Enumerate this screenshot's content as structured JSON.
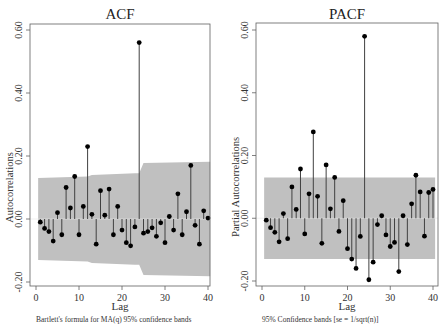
{
  "chart_data": [
    {
      "type": "stem",
      "title": "ACF",
      "xlabel": "Lag",
      "ylabel": "Autocorrelations",
      "note": "Bartlett's formula for MA(q) 95% confidence bands",
      "xlim": [
        0,
        40
      ],
      "ylim": [
        -0.2,
        0.6
      ],
      "xticks": [
        0,
        10,
        20,
        30,
        40
      ],
      "yticks": [
        "-0.20",
        "0.00",
        "0.20",
        "0.40",
        "0.60"
      ],
      "grid": false,
      "lags": [
        1,
        2,
        3,
        4,
        5,
        6,
        7,
        8,
        9,
        10,
        11,
        12,
        13,
        14,
        15,
        16,
        17,
        18,
        19,
        20,
        21,
        22,
        23,
        24,
        25,
        26,
        27,
        28,
        29,
        30,
        31,
        32,
        33,
        34,
        35,
        36,
        37,
        38,
        39,
        40
      ],
      "values": [
        -0.01,
        -0.03,
        -0.04,
        -0.07,
        0.02,
        -0.05,
        0.1,
        0.035,
        0.135,
        -0.05,
        0.04,
        0.23,
        0.015,
        -0.08,
        0.09,
        0.012,
        0.095,
        -0.05,
        0.04,
        -0.035,
        -0.075,
        -0.085,
        -0.025,
        0.56,
        -0.045,
        -0.04,
        -0.028,
        -0.055,
        -0.012,
        -0.075,
        0.008,
        -0.035,
        0.08,
        -0.05,
        0.023,
        0.17,
        -0.02,
        -0.08,
        0.026,
        0.003
      ],
      "confidence_band": {
        "lags": [
          1,
          12,
          13,
          23,
          24,
          25,
          40
        ],
        "upper": [
          0.13,
          0.135,
          0.14,
          0.145,
          0.145,
          0.178,
          0.182
        ],
        "lower": [
          -0.13,
          -0.135,
          -0.14,
          -0.145,
          -0.145,
          -0.178,
          -0.182
        ]
      }
    },
    {
      "type": "stem",
      "title": "PACF",
      "xlabel": "Lag",
      "ylabel": "Partial Autocorrelations",
      "note": "95% Confidence bands [se = 1/sqrt(n)]",
      "xlim": [
        0,
        40
      ],
      "ylim": [
        -0.2,
        0.6
      ],
      "xticks": [
        0,
        10,
        20,
        30,
        40
      ],
      "yticks": [
        "-0.20",
        "0.00",
        "0.20",
        "0.40",
        "0.60"
      ],
      "grid": false,
      "lags": [
        1,
        2,
        3,
        4,
        5,
        6,
        7,
        8,
        9,
        10,
        11,
        12,
        13,
        14,
        15,
        16,
        17,
        18,
        19,
        20,
        21,
        22,
        23,
        24,
        25,
        26,
        27,
        28,
        29,
        30,
        31,
        32,
        33,
        34,
        35,
        36,
        37,
        38,
        39,
        40
      ],
      "values": [
        -0.006,
        -0.03,
        -0.045,
        -0.075,
        0.015,
        -0.065,
        0.1,
        0.028,
        0.157,
        -0.05,
        0.078,
        0.275,
        0.07,
        -0.08,
        0.17,
        0.03,
        0.13,
        -0.042,
        0.056,
        -0.097,
        -0.13,
        -0.16,
        -0.058,
        0.58,
        -0.196,
        -0.14,
        -0.02,
        0.008,
        -0.053,
        -0.09,
        -0.077,
        -0.17,
        0.008,
        -0.084,
        0.046,
        0.137,
        0.084,
        -0.057,
        0.082,
        0.092
      ],
      "confidence_band": {
        "lags": [
          1,
          40
        ],
        "upper": [
          0.13,
          0.13
        ],
        "lower": [
          -0.13,
          -0.13
        ]
      }
    }
  ],
  "style": {
    "band_color": "#c0c0c0",
    "stem_color": "#404040",
    "marker_color": "#000000",
    "frame_color": "#606060",
    "zero_line_color": "#e8e8e8"
  }
}
